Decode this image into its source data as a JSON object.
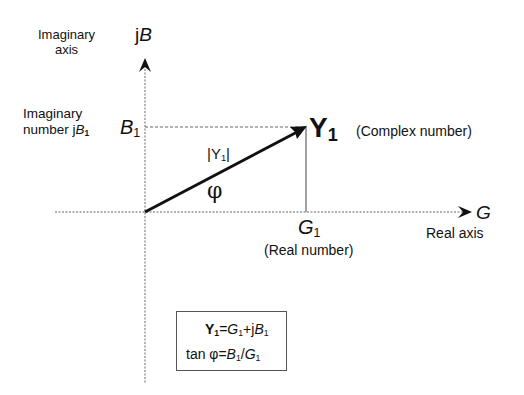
{
  "diagram": {
    "axes": {
      "imaginary": {
        "symbol_prefix": "j",
        "symbol": "B",
        "caption_line1": "Imaginary",
        "caption_line2": "axis"
      },
      "real": {
        "symbol": "G",
        "caption": "Real axis"
      }
    },
    "imaginary_component": {
      "caption_line1": "Imaginary",
      "caption_line2_prefix": "number ",
      "caption_j": "j",
      "caption_symbol": "B",
      "caption_sub": "1",
      "axis_symbol": "B",
      "axis_sub": "1"
    },
    "real_component": {
      "symbol": "G",
      "sub": "1",
      "caption": "(Real number)"
    },
    "vector": {
      "symbol": "Y",
      "sub": "1",
      "caption": "(Complex number)",
      "magnitude_label_open": "|Y",
      "magnitude_label_sub": "1",
      "magnitude_label_close": "|",
      "angle_label": "φ"
    },
    "formulas": {
      "line1": {
        "lhs": "Y",
        "lhs_sub": "1",
        "eq": "=",
        "g": "G",
        "g_sub": "1",
        "plus": "+j",
        "b": "B",
        "b_sub": "1"
      },
      "line2": {
        "prefix": "tan φ=",
        "b": "B",
        "b_sub": "1",
        "slash": "/",
        "g": "G",
        "g_sub": "1"
      }
    },
    "colors": {
      "ink": "#111111",
      "dotted_axis": "#666666",
      "box_border": "#555555"
    }
  }
}
